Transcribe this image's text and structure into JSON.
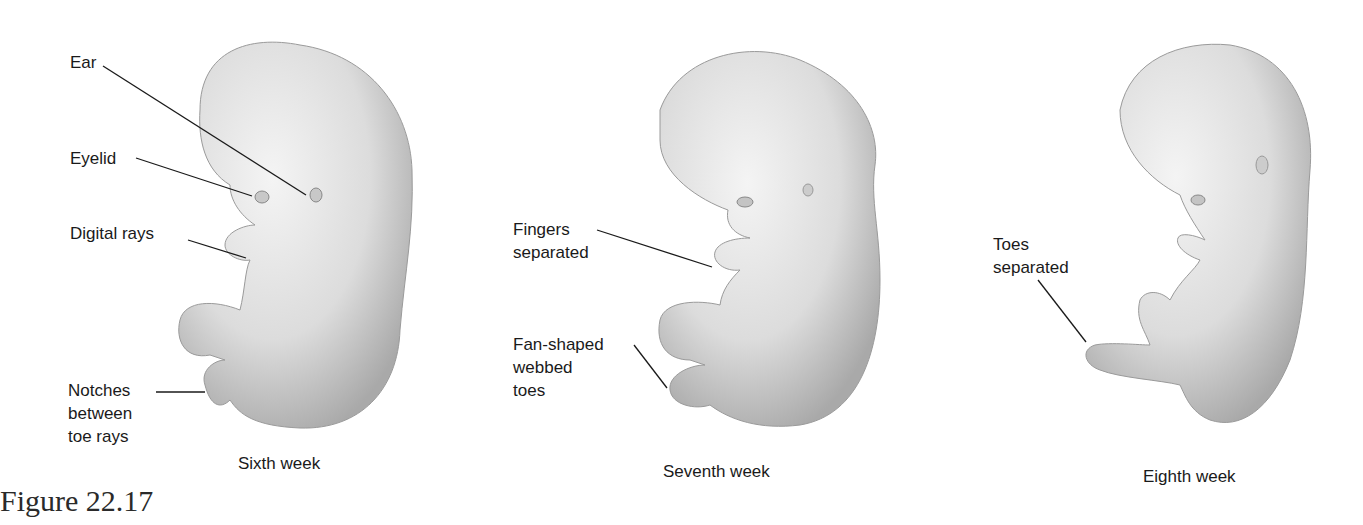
{
  "figure": {
    "number": "Figure 22.17",
    "panels": [
      {
        "caption": "Sixth week",
        "labels": [
          "Ear",
          "Eyelid",
          "Digital rays",
          "Notches\nbetween\ntoe rays"
        ]
      },
      {
        "caption": "Seventh week",
        "labels": [
          "Fingers\nseparated",
          "Fan-shaped\nwebbed\ntoes"
        ]
      },
      {
        "caption": "Eighth week",
        "labels": [
          "Toes\nseparated"
        ]
      }
    ]
  },
  "colors": {
    "background": "#ffffff",
    "skin_light": "#eeeeee",
    "skin_shade": "#bdbdbd",
    "leader_line": "#1a1a1a"
  }
}
